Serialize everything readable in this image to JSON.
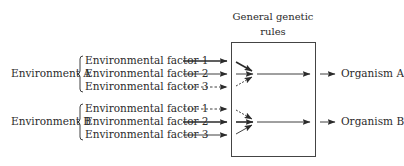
{
  "box": {
    "title_line1": "General genetic",
    "title_line2": "rules"
  },
  "environments": [
    {
      "label": "Environment A",
      "factors": [
        {
          "label": "Environmental factor 1",
          "line": "thick"
        },
        {
          "label": "Environmental factor 2",
          "line": "solid"
        },
        {
          "label": "Environmental factor 3",
          "line": "dashed"
        }
      ],
      "organism": "Organism A"
    },
    {
      "label": "Environment B",
      "factors": [
        {
          "label": "Environmental factor 1",
          "line": "dashed"
        },
        {
          "label": "Environmental factor 2",
          "line": "thick"
        },
        {
          "label": "Environmental factor 3",
          "line": "solid"
        }
      ],
      "organism": "Organism B"
    }
  ],
  "colors": {
    "ink": "#2b2b2b",
    "background": "#ffffff"
  }
}
